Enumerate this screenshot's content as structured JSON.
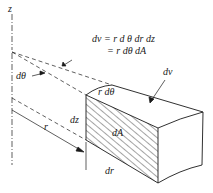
{
  "diagram": {
    "type": "cylindrical volume element",
    "equation": {
      "line1": "dv = r d θ dr dz",
      "line2": "= r dθ  dA"
    },
    "labels": {
      "z_axis": "z",
      "dtheta": "dθ",
      "r_dtheta": "r dθ",
      "dv": "dv",
      "dz": "dz",
      "dA": "dA",
      "r": "r",
      "dr": "dr"
    },
    "colors": {
      "line": "#1a1a1a",
      "background": "#ffffff"
    }
  }
}
